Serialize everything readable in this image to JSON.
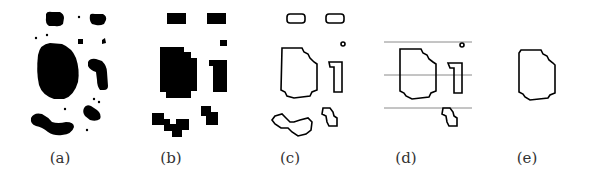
{
  "figure": {
    "panels": [
      {
        "id": "a",
        "label": "(a)",
        "label_x": 60,
        "description": "binary image with noise blobs"
      },
      {
        "id": "b",
        "label": "(b)",
        "label_x": 171,
        "description": "pixelated blocks after morphology"
      },
      {
        "id": "c",
        "label": "(c)",
        "label_x": 290,
        "description": "contours of all regions"
      },
      {
        "id": "d",
        "label": "(d)",
        "label_x": 406,
        "description": "contours with horizontal reference lines"
      },
      {
        "id": "e",
        "label": "(e)",
        "label_x": 527,
        "description": "single selected contour"
      }
    ],
    "colors": {
      "foreground": "#000000",
      "background": "#ffffff",
      "reference_line": "#8a8a8a",
      "label": "#333333"
    }
  }
}
